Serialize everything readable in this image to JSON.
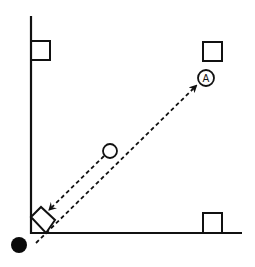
{
  "diagram": {
    "width": 255,
    "height": 267,
    "colors": {
      "background": "#ffffff",
      "stroke": "#111111",
      "fill_dark": "#0a0a0a"
    },
    "axes": {
      "vertical": {
        "x1": 31,
        "y1": 16,
        "x2": 31,
        "y2": 234
      },
      "horizontal": {
        "x1": 30,
        "y1": 233,
        "x2": 242,
        "y2": 233
      }
    },
    "squares": [
      {
        "name": "top-left-square",
        "x": 31,
        "y": 41,
        "w": 19,
        "h": 19
      },
      {
        "name": "top-right-square",
        "x": 203,
        "y": 42,
        "w": 19,
        "h": 19
      },
      {
        "name": "bottom-right-square",
        "x": 203,
        "y": 213,
        "w": 19,
        "h": 20
      }
    ],
    "rotated_square": {
      "points": "31,217 41,207 55,220 46,233"
    },
    "labeled_circle": {
      "cx": 206,
      "cy": 78,
      "r": 8,
      "label": "A"
    },
    "open_circle": {
      "cx": 110,
      "cy": 151,
      "r": 7
    },
    "filled_dot": {
      "cx": 19,
      "cy": 245,
      "r": 8
    },
    "dashed_arrows": [
      {
        "name": "dot-to-A-arrow",
        "x1": 36,
        "y1": 243,
        "x2": 196,
        "y2": 86
      },
      {
        "name": "circle-to-square-arrow",
        "x1": 104,
        "y1": 156,
        "x2": 49,
        "y2": 210
      }
    ]
  }
}
